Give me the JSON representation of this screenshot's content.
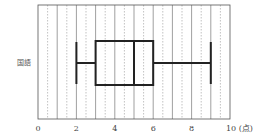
{
  "chart_data": {
    "type": "boxplot",
    "title": "",
    "xlabel": "",
    "ylabel": "",
    "unit_label": "(点)",
    "xlim": [
      0,
      10
    ],
    "x_ticks": [
      0,
      2,
      4,
      6,
      8,
      10
    ],
    "x_tick_labels": [
      "0",
      "2",
      "4",
      "6",
      "8",
      "10 (点)"
    ],
    "grid": {
      "major_every": 1,
      "minor_every": 0.5,
      "major_style": "solid",
      "minor_style": "dotted"
    },
    "series": [
      {
        "name": "国語",
        "min": 2,
        "q1": 3,
        "median": 5,
        "q3": 6,
        "max": 9
      }
    ]
  },
  "colors": {
    "axis": "#555555",
    "grid_major": "#777777",
    "grid_minor": "#999999",
    "box": "#222222",
    "text": "#444444"
  }
}
